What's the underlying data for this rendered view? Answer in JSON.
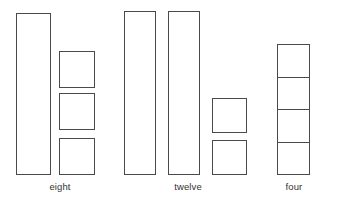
{
  "figure": {
    "background_color": "#ffffff",
    "stroke_color": "#4a4a4a",
    "label_color": "#333333"
  },
  "groups": [
    {
      "id": "group-eight",
      "label": "eight",
      "label_x": 60,
      "label_y": 181,
      "rods": [
        {
          "name": "rod-1",
          "x": 16,
          "y": 13,
          "w": 35,
          "h": 162
        }
      ],
      "units": [
        {
          "name": "unit-1",
          "x": 59,
          "y": 51,
          "w": 36,
          "h": 37
        },
        {
          "name": "unit-2",
          "x": 59,
          "y": 93,
          "w": 36,
          "h": 37
        },
        {
          "name": "unit-3",
          "x": 59,
          "y": 138,
          "w": 36,
          "h": 37
        }
      ],
      "stacks": []
    },
    {
      "id": "group-twelve",
      "label": "twelve",
      "label_x": 188,
      "label_y": 181,
      "rods": [
        {
          "name": "rod-1",
          "x": 124,
          "y": 11,
          "w": 32,
          "h": 164
        },
        {
          "name": "rod-2",
          "x": 168,
          "y": 11,
          "w": 32,
          "h": 164
        }
      ],
      "units": [
        {
          "name": "unit-1",
          "x": 212,
          "y": 98,
          "w": 35,
          "h": 35
        },
        {
          "name": "unit-2",
          "x": 212,
          "y": 140,
          "w": 35,
          "h": 35
        }
      ],
      "stacks": []
    },
    {
      "id": "group-four",
      "label": "four",
      "label_x": 294,
      "label_y": 181,
      "rods": [],
      "units": [],
      "stacks": [
        {
          "name": "unit-stack",
          "x": 277,
          "y": 44,
          "w": 33,
          "h": 131,
          "cells": 4
        }
      ]
    }
  ]
}
